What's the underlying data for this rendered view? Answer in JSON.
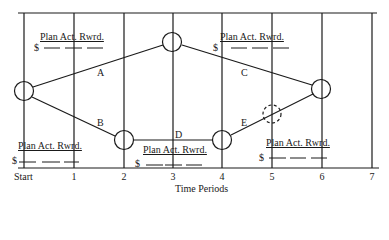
{
  "diagram": {
    "type": "project-network-timeline",
    "axis": {
      "title": "Time Periods",
      "ticks": [
        "Start",
        "1",
        "2",
        "3",
        "4",
        "5",
        "6",
        "7"
      ]
    },
    "edges": [
      {
        "label": "A",
        "from": "start",
        "to": "n3top"
      },
      {
        "label": "B",
        "from": "start",
        "to": "n2"
      },
      {
        "label": "C",
        "from": "n3top",
        "to": "n6"
      },
      {
        "label": "D",
        "from": "n2",
        "to": "n4"
      },
      {
        "label": "E",
        "from": "n4",
        "to": "n6",
        "via": "dashed-node-5"
      }
    ],
    "nodes": [
      {
        "id": "start",
        "period": "Start",
        "style": "solid"
      },
      {
        "id": "n3top",
        "period": "3",
        "style": "solid"
      },
      {
        "id": "n2",
        "period": "2",
        "style": "solid"
      },
      {
        "id": "n4",
        "period": "4",
        "style": "solid"
      },
      {
        "id": "n5",
        "period": "5",
        "style": "dashed"
      },
      {
        "id": "n6",
        "period": "6",
        "style": "solid"
      }
    ],
    "reward_boxes": [
      {
        "header": "Plan Act. Rwrd.",
        "currency": "$",
        "position": "top-left"
      },
      {
        "header": "Plan Act. Rwrd.",
        "currency": "$",
        "position": "top-right"
      },
      {
        "header": "Plan Act. Rwrd.",
        "currency": "$",
        "position": "bottom-left"
      },
      {
        "header": "Plan Act. Rwrd.",
        "currency": "$",
        "position": "bottom-middle"
      },
      {
        "header": "Plan Act. Rwrd.",
        "currency": "$",
        "position": "bottom-right"
      }
    ]
  }
}
